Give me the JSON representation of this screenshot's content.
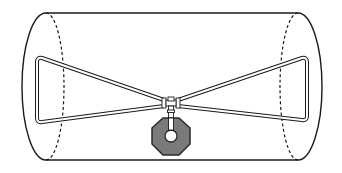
{
  "diagram": {
    "type": "illustration",
    "colors": {
      "background": "#ffffff",
      "outline": "#1a1a1a",
      "rod_fill": "#ffffff",
      "weight_fill": "#7a7a7a",
      "weight_outline": "#2a2a2a"
    },
    "elements": [
      {
        "name": "cylinder",
        "style": "solid outline with dashed inner end ellipses"
      },
      {
        "name": "left-triangle-element",
        "style": "double-line rod"
      },
      {
        "name": "right-triangle-element",
        "style": "double-line rod"
      },
      {
        "name": "center-junction",
        "style": "clamped connector"
      },
      {
        "name": "octagonal-weight",
        "style": "grey octagon with central hole"
      }
    ]
  }
}
